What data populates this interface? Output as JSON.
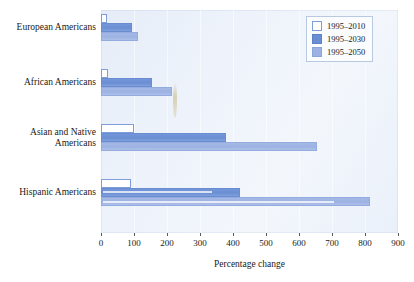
{
  "chart_data": {
    "type": "bar",
    "orientation": "horizontal",
    "title": "",
    "xlabel": "Percentage change",
    "ylabel": "",
    "xlim": [
      0,
      900
    ],
    "xticks": [
      0,
      100,
      200,
      300,
      400,
      500,
      600,
      700,
      800,
      900
    ],
    "grid": true,
    "legend_position": "top-right",
    "categories": [
      "European Americans",
      "African Americans",
      "Asian and Native Americans",
      "Hispanic Americans"
    ],
    "series": [
      {
        "name": "1995–2010",
        "color": "#ffffff",
        "values": [
          18,
          22,
          100,
          90
        ]
      },
      {
        "name": "1995–2030",
        "color": "#6b8ed3",
        "values": [
          95,
          155,
          380,
          420
        ]
      },
      {
        "name": "1995–2050",
        "color": "#9cb2e2",
        "values": [
          112,
          215,
          655,
          815
        ]
      }
    ]
  },
  "legend": {
    "items": [
      {
        "label": "1995–2010"
      },
      {
        "label": "1995–2030"
      },
      {
        "label": "1995–2050"
      }
    ]
  },
  "axis": {
    "x_title": "Percentage change",
    "x_tick_labels": [
      "0",
      "100",
      "200",
      "300",
      "400",
      "500",
      "600",
      "700",
      "800",
      "900"
    ]
  },
  "category_labels": [
    {
      "lines": [
        "European Americans"
      ]
    },
    {
      "lines": [
        "African Americans"
      ]
    },
    {
      "lines": [
        "Asian and Native",
        "Americans"
      ]
    },
    {
      "lines": [
        "Hispanic Americans"
      ]
    }
  ]
}
